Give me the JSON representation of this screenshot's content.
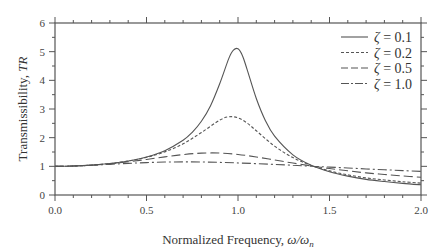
{
  "chart_data": {
    "type": "line",
    "title": "",
    "xlabel": "Normalized Frequency, ω/ωn",
    "xlabel_text": "Normalized Frequency, ",
    "xlabel_math": "ω/ω",
    "xlabel_sub": "n",
    "ylabel": "Transmissibility, TR",
    "ylabel_text": "Transmissibility, ",
    "ylabel_math": "TR",
    "xlim": [
      0,
      2.0
    ],
    "ylim": [
      0,
      6
    ],
    "x_ticks": [
      "0.0",
      "0.5",
      "1.0",
      "1.5",
      "2.0"
    ],
    "x_tick_values": [
      0,
      0.5,
      1.0,
      1.5,
      2.0
    ],
    "x_minor_step": 0.1,
    "y_ticks": [
      "0",
      "1",
      "2",
      "3",
      "4",
      "5",
      "6"
    ],
    "y_tick_values": [
      0,
      1,
      2,
      3,
      4,
      5,
      6
    ],
    "y_minor_step": 0.5,
    "grid": false,
    "legend_position": "upper right",
    "series": [
      {
        "name": "ζ = 0.1",
        "label_symbol": "ζ",
        "label_value": "= 0.1",
        "dash": "",
        "x": [
          0,
          0.1,
          0.2,
          0.3,
          0.4,
          0.5,
          0.6,
          0.7,
          0.75,
          0.8,
          0.85,
          0.9,
          0.95,
          0.975,
          1.0,
          1.025,
          1.05,
          1.1,
          1.15,
          1.2,
          1.3,
          1.4,
          1.5,
          1.6,
          1.7,
          1.8,
          1.9,
          2.0
        ],
        "values": [
          1.0,
          1.01,
          1.042,
          1.099,
          1.189,
          1.328,
          1.547,
          1.909,
          2.186,
          2.571,
          3.117,
          3.882,
          4.766,
          5.05,
          5.099,
          4.85,
          4.373,
          3.367,
          2.591,
          2.052,
          1.401,
          1.038,
          0.812,
          0.659,
          0.545,
          0.469,
          0.406,
          0.356
        ]
      },
      {
        "name": "ζ = 0.2",
        "label_symbol": "ζ",
        "label_value": "= 0.2",
        "dash": "3,2",
        "x": [
          0,
          0.1,
          0.2,
          0.3,
          0.4,
          0.5,
          0.6,
          0.7,
          0.8,
          0.9,
          0.95,
          1.0,
          1.05,
          1.1,
          1.2,
          1.3,
          1.4,
          1.5,
          1.6,
          1.7,
          1.8,
          1.9,
          2.0
        ],
        "values": [
          1.0,
          1.01,
          1.041,
          1.097,
          1.184,
          1.314,
          1.505,
          1.785,
          2.18,
          2.611,
          2.727,
          2.693,
          2.509,
          2.241,
          1.704,
          1.305,
          1.031,
          0.841,
          0.704,
          0.597,
          0.524,
          0.462,
          0.413
        ]
      },
      {
        "name": "ζ = 0.5",
        "label_symbol": "ζ",
        "label_value": "= 0.5",
        "dash": "9,4",
        "x": [
          0,
          0.1,
          0.2,
          0.3,
          0.4,
          0.5,
          0.6,
          0.7,
          0.8,
          0.9,
          1.0,
          1.1,
          1.2,
          1.3,
          1.4,
          1.5,
          1.6,
          1.7,
          1.8,
          1.9,
          2.0
        ],
        "values": [
          1.0,
          1.01,
          1.04,
          1.09,
          1.158,
          1.24,
          1.329,
          1.409,
          1.46,
          1.463,
          1.414,
          1.328,
          1.222,
          1.114,
          1.014,
          0.923,
          0.844,
          0.771,
          0.717,
          0.665,
          0.62
        ]
      },
      {
        "name": "ζ = 1.0",
        "label_symbol": "ζ",
        "label_value": "= 1.0",
        "dash": "9,3,2,3",
        "x": [
          0,
          0.1,
          0.2,
          0.3,
          0.4,
          0.5,
          0.6,
          0.7,
          0.8,
          0.9,
          1.0,
          1.1,
          1.2,
          1.3,
          1.4,
          1.5,
          1.6,
          1.7,
          1.8,
          1.9,
          2.0
        ],
        "values": [
          1.0,
          1.01,
          1.036,
          1.07,
          1.104,
          1.131,
          1.149,
          1.155,
          1.151,
          1.138,
          1.118,
          1.094,
          1.066,
          1.036,
          1.005,
          0.973,
          0.942,
          0.909,
          0.881,
          0.852,
          0.825
        ]
      }
    ]
  },
  "colors": {
    "axis": "#555555",
    "line": "#555555",
    "text": "#333333"
  }
}
